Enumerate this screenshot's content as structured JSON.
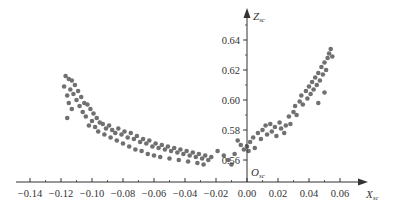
{
  "chart_data": {
    "type": "scatter",
    "title": "",
    "xlabel": "X",
    "xlabel_sub": "sc",
    "ylabel": "Z",
    "ylabel_sub": "sc",
    "origin_label": "O",
    "origin_sub": "sc",
    "xlim": [
      -0.15,
      0.075
    ],
    "ylim": [
      0.555,
      0.65
    ],
    "x_ticks": [
      -0.14,
      -0.12,
      -0.1,
      -0.08,
      -0.06,
      -0.04,
      -0.02,
      0.0,
      0.02,
      0.04,
      0.06
    ],
    "x_tick_labels": [
      "−0.14",
      "−0.12",
      "−0.10",
      "−0.08",
      "−0.06",
      "−0.04",
      "−0.02",
      "0.00",
      "0.02",
      "0.04",
      "0.06"
    ],
    "y_ticks": [
      0.56,
      0.58,
      0.6,
      0.62,
      0.64
    ],
    "y_tick_labels": [
      "0.56",
      "0.58",
      "0.60",
      "0.62",
      "0.64"
    ],
    "grid": false,
    "legend": null,
    "marker_color": "#707070",
    "axis_color": "#333333",
    "series": [
      {
        "name": "points",
        "points": [
          [
            -0.117,
            0.616
          ],
          [
            -0.115,
            0.614
          ],
          [
            -0.113,
            0.613
          ],
          [
            -0.118,
            0.609
          ],
          [
            -0.114,
            0.607
          ],
          [
            -0.111,
            0.61
          ],
          [
            -0.116,
            0.603
          ],
          [
            -0.112,
            0.604
          ],
          [
            -0.109,
            0.606
          ],
          [
            -0.115,
            0.598
          ],
          [
            -0.11,
            0.6
          ],
          [
            -0.107,
            0.602
          ],
          [
            -0.105,
            0.598
          ],
          [
            -0.113,
            0.594
          ],
          [
            -0.108,
            0.596
          ],
          [
            -0.103,
            0.597
          ],
          [
            -0.106,
            0.592
          ],
          [
            -0.101,
            0.594
          ],
          [
            -0.116,
            0.588
          ],
          [
            -0.104,
            0.589
          ],
          [
            -0.099,
            0.591
          ],
          [
            -0.1,
            0.586
          ],
          [
            -0.097,
            0.588
          ],
          [
            -0.095,
            0.585
          ],
          [
            -0.102,
            0.583
          ],
          [
            -0.098,
            0.582
          ],
          [
            -0.093,
            0.584
          ],
          [
            -0.091,
            0.581
          ],
          [
            -0.096,
            0.579
          ],
          [
            -0.089,
            0.583
          ],
          [
            -0.087,
            0.58
          ],
          [
            -0.092,
            0.577
          ],
          [
            -0.085,
            0.578
          ],
          [
            -0.083,
            0.581
          ],
          [
            -0.088,
            0.575
          ],
          [
            -0.081,
            0.577
          ],
          [
            -0.079,
            0.579
          ],
          [
            -0.084,
            0.573
          ],
          [
            -0.077,
            0.575
          ],
          [
            -0.075,
            0.578
          ],
          [
            -0.08,
            0.571
          ],
          [
            -0.073,
            0.574
          ],
          [
            -0.071,
            0.576
          ],
          [
            -0.076,
            0.569
          ],
          [
            -0.069,
            0.572
          ],
          [
            -0.067,
            0.574
          ],
          [
            -0.072,
            0.567
          ],
          [
            -0.065,
            0.571
          ],
          [
            -0.063,
            0.573
          ],
          [
            -0.068,
            0.566
          ],
          [
            -0.061,
            0.569
          ],
          [
            -0.059,
            0.571
          ],
          [
            -0.064,
            0.564
          ],
          [
            -0.057,
            0.568
          ],
          [
            -0.055,
            0.57
          ],
          [
            -0.06,
            0.563
          ],
          [
            -0.053,
            0.567
          ],
          [
            -0.051,
            0.569
          ],
          [
            -0.049,
            0.566
          ],
          [
            -0.056,
            0.562
          ],
          [
            -0.047,
            0.568
          ],
          [
            -0.045,
            0.565
          ],
          [
            -0.043,
            0.567
          ],
          [
            -0.05,
            0.561
          ],
          [
            -0.041,
            0.564
          ],
          [
            -0.039,
            0.566
          ],
          [
            -0.037,
            0.563
          ],
          [
            -0.044,
            0.56
          ],
          [
            -0.035,
            0.565
          ],
          [
            -0.033,
            0.562
          ],
          [
            -0.031,
            0.564
          ],
          [
            -0.038,
            0.559
          ],
          [
            -0.029,
            0.561
          ],
          [
            -0.027,
            0.563
          ],
          [
            -0.032,
            0.558
          ],
          [
            -0.025,
            0.56
          ],
          [
            -0.023,
            0.562
          ],
          [
            -0.028,
            0.557
          ],
          [
            -0.019,
            0.566
          ],
          [
            -0.015,
            0.563
          ],
          [
            -0.012,
            0.56
          ],
          [
            -0.01,
            0.557
          ],
          [
            -0.008,
            0.564
          ],
          [
            -0.006,
            0.573
          ],
          [
            -0.004,
            0.57
          ],
          [
            -0.002,
            0.567
          ],
          [
            0.0,
            0.569
          ],
          [
            0.001,
            0.566
          ],
          [
            0.002,
            0.572
          ],
          [
            0.004,
            0.575
          ],
          [
            0.005,
            0.568
          ],
          [
            0.007,
            0.578
          ],
          [
            0.009,
            0.574
          ],
          [
            0.01,
            0.58
          ],
          [
            0.012,
            0.583
          ],
          [
            0.013,
            0.577
          ],
          [
            0.015,
            0.584
          ],
          [
            0.016,
            0.579
          ],
          [
            0.018,
            0.582
          ],
          [
            0.019,
            0.576
          ],
          [
            0.021,
            0.585
          ],
          [
            0.022,
            0.581
          ],
          [
            0.024,
            0.578
          ],
          [
            0.025,
            0.583
          ],
          [
            0.027,
            0.589
          ],
          [
            0.028,
            0.584
          ],
          [
            0.03,
            0.592
          ],
          [
            0.031,
            0.596
          ],
          [
            0.032,
            0.59
          ],
          [
            0.034,
            0.599
          ],
          [
            0.035,
            0.603
          ],
          [
            0.036,
            0.597
          ],
          [
            0.038,
            0.606
          ],
          [
            0.039,
            0.601
          ],
          [
            0.04,
            0.609
          ],
          [
            0.041,
            0.604
          ],
          [
            0.042,
            0.612
          ],
          [
            0.043,
            0.607
          ],
          [
            0.044,
            0.615
          ],
          [
            0.045,
            0.61
          ],
          [
            0.046,
            0.618
          ],
          [
            0.047,
            0.613
          ],
          [
            0.048,
            0.622
          ],
          [
            0.049,
            0.617
          ],
          [
            0.05,
            0.625
          ],
          [
            0.051,
            0.62
          ],
          [
            0.052,
            0.628
          ],
          [
            0.053,
            0.631
          ],
          [
            0.054,
            0.634
          ],
          [
            0.055,
            0.629
          ],
          [
            0.046,
            0.598
          ],
          [
            0.05,
            0.605
          ]
        ]
      }
    ]
  }
}
